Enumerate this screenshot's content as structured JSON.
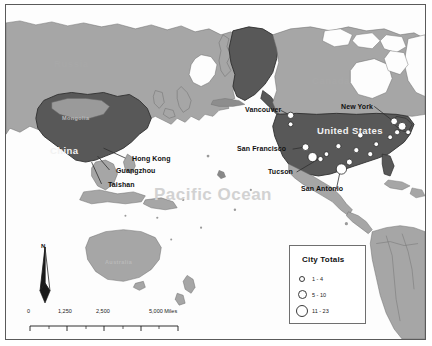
{
  "map": {
    "title": "Pacific Ocean reference map",
    "ocean_label": "Pacific Ocean",
    "countries": [
      {
        "name": "Russia",
        "style": "light"
      },
      {
        "name": "Mongolia",
        "style": "faint"
      },
      {
        "name": "China",
        "style": "dark"
      },
      {
        "name": "Canada",
        "style": "light"
      },
      {
        "name": "United States",
        "style": "dark"
      },
      {
        "name": "Australia",
        "style": "faint"
      }
    ],
    "city_labels": [
      {
        "name": "Hong Kong"
      },
      {
        "name": "Guangzhou"
      },
      {
        "name": "Taishan"
      },
      {
        "name": "Vancouver"
      },
      {
        "name": "New York"
      },
      {
        "name": "San Francisco"
      },
      {
        "name": "Tucson"
      },
      {
        "name": "San Antonio"
      }
    ],
    "legend": {
      "title": "City Totals",
      "classes": [
        {
          "label": "1 - 4",
          "size": 5
        },
        {
          "label": "5 - 10",
          "size": 8
        },
        {
          "label": "11 - 23",
          "size": 11
        }
      ]
    },
    "north_arrow": {
      "label": "N"
    },
    "scale_bar": {
      "ticks": [
        "0",
        "1,250",
        "2,500",
        "5,000 Miles"
      ]
    },
    "colors": {
      "land_light": "#a6a6a6",
      "land_dark": "#585858",
      "ocean_fill": "#fdfdfd",
      "border": "#5a5a5a",
      "symbol_fill": "#ffffff"
    }
  }
}
